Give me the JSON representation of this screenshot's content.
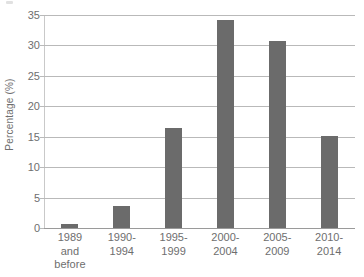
{
  "chart_data": {
    "type": "bar",
    "title": "",
    "subtitle": "",
    "xlabel": "",
    "ylabel": "Percentage (%)",
    "categories": [
      "1989 and before",
      "1990-1994",
      "1995-1999",
      "2000-2004",
      "2005-2009",
      "2010-2014"
    ],
    "category_lines": [
      [
        "1989",
        "and",
        "before"
      ],
      [
        "1990-",
        "1994"
      ],
      [
        "1995-",
        "1999"
      ],
      [
        "2000-",
        "2004"
      ],
      [
        "2005-",
        "2009"
      ],
      [
        "2010-",
        "2014"
      ]
    ],
    "values": [
      0.7,
      3.6,
      16.5,
      34.2,
      30.8,
      15.2
    ],
    "ylim": [
      0,
      35
    ],
    "yticks": [
      0,
      5,
      10,
      15,
      20,
      25,
      30,
      35
    ],
    "ytick_labels": [
      "0",
      "5",
      "10",
      "15",
      "20",
      "25",
      "30",
      "35"
    ],
    "grid": true,
    "legend": false,
    "legend_position": "none",
    "bar_color": "#6b6b6b",
    "grid_color": "#b9b9b9",
    "axis_color": "#9a9a9a",
    "text_color": "#6e6e6e"
  }
}
